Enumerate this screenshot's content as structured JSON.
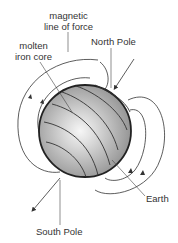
{
  "diagram": {
    "labels": {
      "magnetic_line_1": "magnetic",
      "magnetic_line_2": "line of force",
      "core_1": "molten",
      "core_2": "iron core",
      "north": "North Pole",
      "south": "South Pole",
      "earth": "Earth"
    },
    "colors": {
      "line": "#333333",
      "sphere_edge": "#222222",
      "sphere_dark": "#8a8a8a",
      "sphere_light": "#f4f4f4"
    }
  }
}
